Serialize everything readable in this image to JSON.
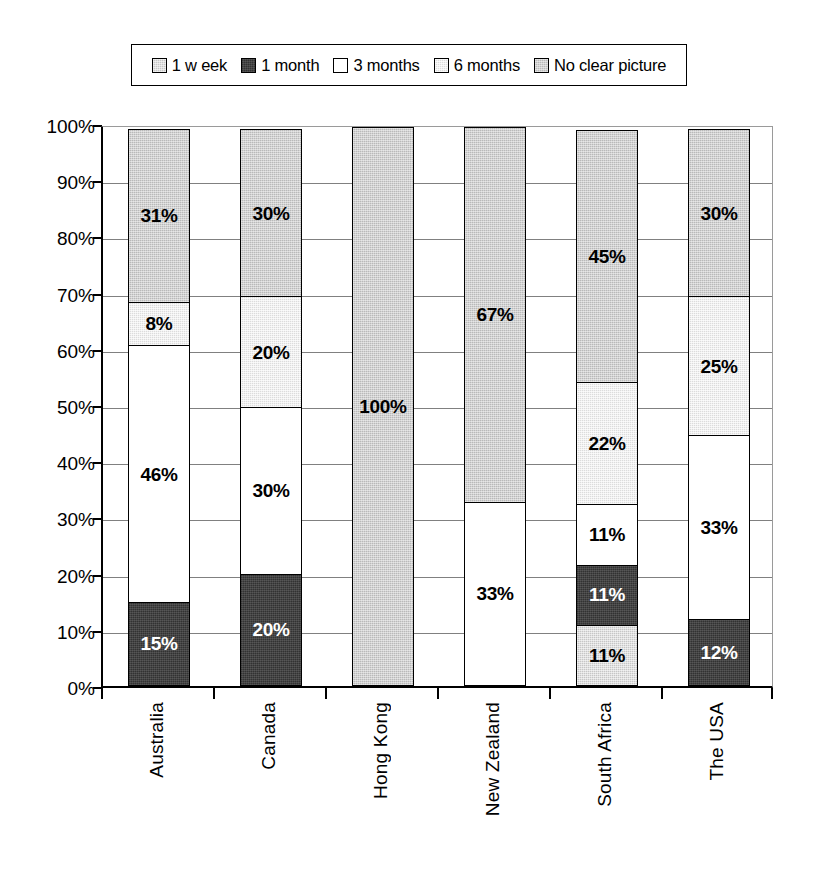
{
  "legend": {
    "position": "top",
    "items": [
      {
        "label": "1 w eek",
        "key": "week",
        "swatch_color": "#c6c6c6",
        "icon": "legend-swatch-icon"
      },
      {
        "label": "1 month",
        "key": "month",
        "swatch_color": "#434343",
        "icon": "legend-swatch-icon"
      },
      {
        "label": "3 months",
        "key": "3months",
        "swatch_color": "#ffffff",
        "icon": "legend-swatch-icon"
      },
      {
        "label": "6 months",
        "key": "6months",
        "swatch_color": "#dcdcdc",
        "icon": "legend-swatch-icon"
      },
      {
        "label": "No clear picture",
        "key": "noclear",
        "swatch_color": "#b9b9b9",
        "icon": "legend-swatch-icon"
      }
    ]
  },
  "axis": {
    "y_ticks": [
      "0%",
      "10%",
      "20%",
      "30%",
      "40%",
      "50%",
      "60%",
      "70%",
      "80%",
      "90%",
      "100%"
    ]
  },
  "chart_data": {
    "type": "bar",
    "subtype": "stacked-100-percent",
    "title": "",
    "xlabel": "",
    "ylabel": "",
    "ylim": [
      0,
      100
    ],
    "ytick_labels": [
      "0%",
      "10%",
      "20%",
      "30%",
      "40%",
      "50%",
      "60%",
      "70%",
      "80%",
      "90%",
      "100%"
    ],
    "grid": true,
    "legend_position": "top",
    "categories": [
      "Australia",
      "Canada",
      "Hong Kong",
      "New Zealand",
      "South Africa",
      "The USA"
    ],
    "series": [
      {
        "name": "1 w eek",
        "color": "#c6c6c6",
        "values": [
          0,
          0,
          0,
          0,
          11,
          0
        ]
      },
      {
        "name": "1 month",
        "color": "#434343",
        "values": [
          15,
          20,
          0,
          0,
          11,
          12
        ]
      },
      {
        "name": "3 months",
        "color": "#ffffff",
        "values": [
          46,
          30,
          0,
          33,
          11,
          33
        ]
      },
      {
        "name": "6 months",
        "color": "#dcdcdc",
        "values": [
          8,
          20,
          0,
          0,
          22,
          25
        ]
      },
      {
        "name": "No clear picture",
        "color": "#b9b9b9",
        "values": [
          31,
          30,
          100,
          67,
          45,
          30
        ]
      }
    ],
    "bars": [
      {
        "category": "Australia",
        "segments": [
          {
            "series": "1 month",
            "value": 15,
            "label": "15%",
            "fill": "month",
            "text": "light"
          },
          {
            "series": "3 months",
            "value": 46,
            "label": "46%",
            "fill": "3months",
            "text": "dark"
          },
          {
            "series": "6 months",
            "value": 8,
            "label": "8%",
            "fill": "6months",
            "text": "dark"
          },
          {
            "series": "No clear picture",
            "value": 31,
            "label": "31%",
            "fill": "noclear",
            "text": "dark"
          }
        ]
      },
      {
        "category": "Canada",
        "segments": [
          {
            "series": "1 month",
            "value": 20,
            "label": "20%",
            "fill": "month",
            "text": "light"
          },
          {
            "series": "3 months",
            "value": 30,
            "label": "30%",
            "fill": "3months",
            "text": "dark"
          },
          {
            "series": "6 months",
            "value": 20,
            "label": "20%",
            "fill": "6months",
            "text": "dark"
          },
          {
            "series": "No clear picture",
            "value": 30,
            "label": "30%",
            "fill": "noclear",
            "text": "dark"
          }
        ]
      },
      {
        "category": "Hong Kong",
        "segments": [
          {
            "series": "No clear picture",
            "value": 100,
            "label": "100%",
            "fill": "noclear",
            "text": "dark"
          }
        ]
      },
      {
        "category": "New Zealand",
        "segments": [
          {
            "series": "3 months",
            "value": 33,
            "label": "33%",
            "fill": "3months",
            "text": "dark"
          },
          {
            "series": "No clear picture",
            "value": 67,
            "label": "67%",
            "fill": "noclear",
            "text": "dark"
          }
        ]
      },
      {
        "category": "South Africa",
        "segments": [
          {
            "series": "1 w eek",
            "value": 11,
            "label": "11%",
            "fill": "week",
            "text": "dark"
          },
          {
            "series": "1 month",
            "value": 11,
            "label": "11%",
            "fill": "month",
            "text": "light"
          },
          {
            "series": "3 months",
            "value": 11,
            "label": "11%",
            "fill": "3months",
            "text": "dark"
          },
          {
            "series": "6 months",
            "value": 22,
            "label": "22%",
            "fill": "6months",
            "text": "dark"
          },
          {
            "series": "No clear picture",
            "value": 45,
            "label": "45%",
            "fill": "noclear",
            "text": "dark"
          }
        ]
      },
      {
        "category": "The USA",
        "segments": [
          {
            "series": "1 month",
            "value": 12,
            "label": "12%",
            "fill": "month",
            "text": "light"
          },
          {
            "series": "3 months",
            "value": 33,
            "label": "33%",
            "fill": "3months",
            "text": "dark"
          },
          {
            "series": "6 months",
            "value": 25,
            "label": "25%",
            "fill": "6months",
            "text": "dark"
          },
          {
            "series": "No clear picture",
            "value": 30,
            "label": "30%",
            "fill": "noclear",
            "text": "dark"
          }
        ]
      }
    ]
  }
}
